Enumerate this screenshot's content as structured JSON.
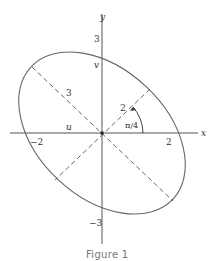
{
  "figure": {
    "caption": "Figure 1",
    "axes": {
      "x_label": "x",
      "y_label": "y",
      "x_ticks": [
        "−2",
        "2"
      ],
      "y_ticks": [
        "3",
        "−3"
      ]
    },
    "labels": {
      "u": "u",
      "v": "v",
      "semi_major": "3",
      "semi_minor": "2",
      "angle": "π/4"
    },
    "ellipse": {
      "center": [
        0,
        0
      ],
      "semi_major_axis": 3,
      "semi_minor_axis": 2,
      "rotation": "-π/4 (major axis along u, from upper-left to lower-right)"
    },
    "colors": {
      "stroke": "#555555",
      "text": "#333333",
      "caption": "#777777"
    }
  }
}
